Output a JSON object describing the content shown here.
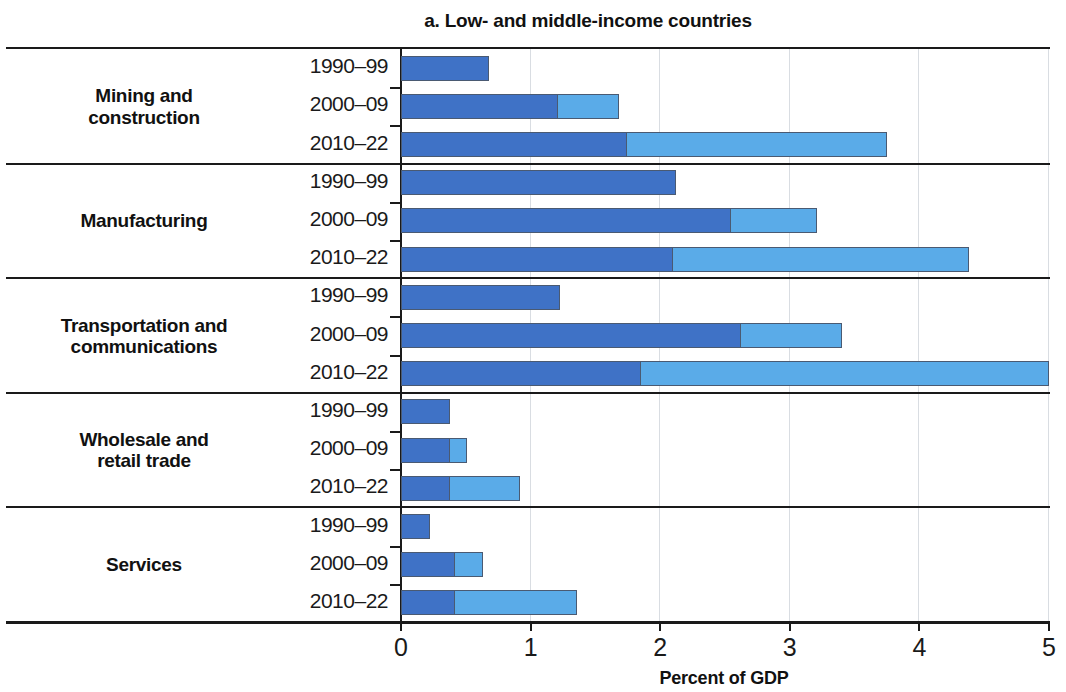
{
  "chart_data": {
    "type": "bar",
    "orientation": "horizontal",
    "stacked": true,
    "title": "a. Low- and middle-income countries",
    "xlabel": "Percent of GDP",
    "ylabel": "",
    "xlim": [
      0,
      5
    ],
    "xticks": [
      0,
      1,
      2,
      3,
      4,
      5
    ],
    "xtick_labels": [
      "0",
      "1",
      "2",
      "3",
      "4",
      "5"
    ],
    "grid": true,
    "legend": null,
    "colors": {
      "segment_1": "#3f72c6",
      "segment_2": "#5aabe8",
      "bar_outline": "#4a5a72",
      "axis": "#1a1a1a",
      "gridline": "#d9dde2",
      "background": "#ffffff"
    },
    "series": [
      {
        "name": "segment-1",
        "color": "#3f72c6"
      },
      {
        "name": "segment-2",
        "color": "#5aabe8"
      }
    ],
    "groups": [
      {
        "label": "Mining and\nconstruction",
        "label_lines": [
          "Mining and",
          "construction"
        ],
        "rows": [
          {
            "period": "1990–99",
            "segment_1": 0.68,
            "segment_2": 0.0,
            "total": 0.68
          },
          {
            "period": "2000–09",
            "segment_1": 1.21,
            "segment_2": 0.47,
            "total": 1.68
          },
          {
            "period": "2010–22",
            "segment_1": 1.74,
            "segment_2": 2.01,
            "total": 3.75
          }
        ]
      },
      {
        "label": "Manufacturing",
        "label_lines": [
          "Manufacturing"
        ],
        "rows": [
          {
            "period": "1990–99",
            "segment_1": 2.12,
            "segment_2": 0.0,
            "total": 2.12
          },
          {
            "period": "2000–09",
            "segment_1": 2.55,
            "segment_2": 0.66,
            "total": 3.21
          },
          {
            "period": "2010–22",
            "segment_1": 2.1,
            "segment_2": 2.28,
            "total": 4.38
          }
        ]
      },
      {
        "label": "Transportation and\ncommunications",
        "label_lines": [
          "Transportation and",
          "communications"
        ],
        "rows": [
          {
            "period": "1990–99",
            "segment_1": 1.23,
            "segment_2": 0.0,
            "total": 1.23
          },
          {
            "period": "2000–09",
            "segment_1": 2.62,
            "segment_2": 0.78,
            "total": 3.4
          },
          {
            "period": "2010–22",
            "segment_1": 1.85,
            "segment_2": 3.15,
            "total": 5.0
          }
        ]
      },
      {
        "label": "Wholesale and\nretail trade",
        "label_lines": [
          "Wholesale and",
          "retail trade"
        ],
        "rows": [
          {
            "period": "1990–99",
            "segment_1": 0.38,
            "segment_2": 0.0,
            "total": 0.38
          },
          {
            "period": "2000–09",
            "segment_1": 0.38,
            "segment_2": 0.13,
            "total": 0.51
          },
          {
            "period": "2010–22",
            "segment_1": 0.38,
            "segment_2": 0.54,
            "total": 0.92
          }
        ]
      },
      {
        "label": "Services",
        "label_lines": [
          "Services"
        ],
        "rows": [
          {
            "period": "1990–99",
            "segment_1": 0.22,
            "segment_2": 0.0,
            "total": 0.22
          },
          {
            "period": "2000–09",
            "segment_1": 0.42,
            "segment_2": 0.21,
            "total": 0.63
          },
          {
            "period": "2010–22",
            "segment_1": 0.42,
            "segment_2": 0.94,
            "total": 1.36
          }
        ]
      }
    ]
  }
}
